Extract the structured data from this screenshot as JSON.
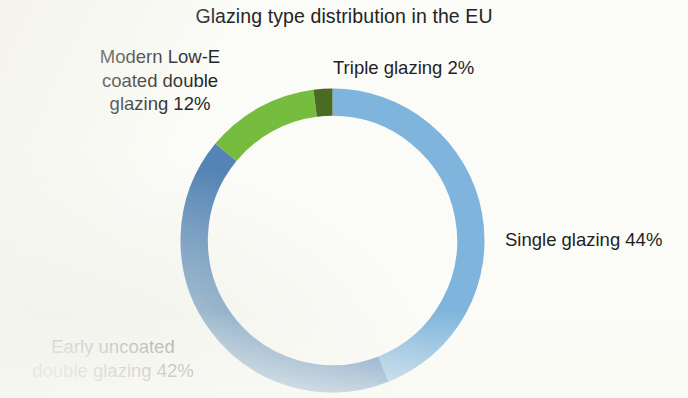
{
  "chart_data": {
    "type": "pie",
    "variant": "donut",
    "title": "Glazing type distribution in the EU",
    "xlabel": "",
    "ylabel": "",
    "units": "percent",
    "legend_position": "outside-labels",
    "grid": false,
    "start_angle_deg": 0,
    "direction": "clockwise",
    "inner_radius_ratio": 0.82,
    "categories": [
      "Single glazing",
      "Early uncoated double glazing",
      "Modern Low-E coated double glazing",
      "Triple glazing"
    ],
    "values": [
      44,
      42,
      12,
      2
    ],
    "slices": [
      {
        "name": "Single glazing",
        "value": 44,
        "label": "Single glazing 44%",
        "color": "#7fb5dc",
        "start_pct": 0,
        "end_pct": 44
      },
      {
        "name": "Early uncoated double glazing",
        "value": 42,
        "label": "Early uncoated\ndouble glazing 42%",
        "color": "#5384b5",
        "start_pct": 44,
        "end_pct": 86
      },
      {
        "name": "Modern Low-E coated double glazing",
        "value": 12,
        "label": "Modern Low-E\ncoated double\nglazing 12%",
        "color": "#76bc3f",
        "start_pct": 86,
        "end_pct": 98
      },
      {
        "name": "Triple glazing",
        "value": 2,
        "label": "Triple glazing 2%",
        "color": "#4a6b22",
        "start_pct": 98,
        "end_pct": 100
      }
    ]
  },
  "labels": {
    "low_e": "Modern Low-E\ncoated double\nglazing 12%",
    "triple": "Triple glazing 2%",
    "single": "Single glazing 44%",
    "early": "Early uncoated\ndouble glazing 42%"
  },
  "colors": {
    "single": "#7fb5dc",
    "early": "#5384b5",
    "low_e": "#76bc3f",
    "triple": "#4a6b22",
    "background": "#fbfbf7",
    "text": "#1f1f1f"
  }
}
